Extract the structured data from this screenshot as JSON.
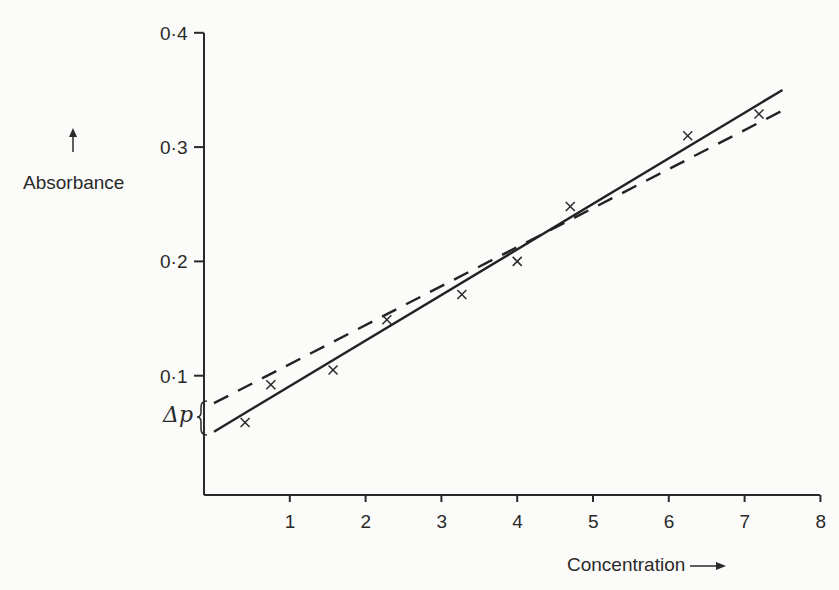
{
  "chart_data": {
    "type": "scatter",
    "title": "",
    "xlabel": "Concentration",
    "ylabel": "Absorbance",
    "xlim": [
      0,
      8
    ],
    "ylim": [
      0,
      0.4
    ],
    "x_ticks": [
      "1",
      "2",
      "3",
      "4",
      "5",
      "6",
      "7",
      "8"
    ],
    "y_ticks": [
      "0·1",
      "0·2",
      "0·3",
      "0·4"
    ],
    "grid": false,
    "legend": null,
    "marker": "x",
    "series": [
      {
        "name": "measured points",
        "x": [
          0.41,
          0.75,
          1.57,
          2.28,
          3.27,
          4.0,
          4.7,
          6.25,
          7.19
        ],
        "y": [
          0.059,
          0.092,
          0.105,
          0.149,
          0.171,
          0.2,
          0.248,
          0.31,
          0.329
        ]
      },
      {
        "name": "solid fit line",
        "style": "solid",
        "x": [
          0,
          7.5
        ],
        "y": [
          0.051,
          0.35
        ]
      },
      {
        "name": "dashed fit line",
        "style": "dashed",
        "x": [
          0,
          7.56
        ],
        "y": [
          0.076,
          0.334
        ]
      }
    ],
    "annotations": [
      {
        "text": "Δp",
        "note": "brace marking intercept difference between dashed and solid lines at x=0"
      }
    ]
  },
  "labels": {
    "ylabel": "Absorbance",
    "xlabel": "Concentration",
    "delta_p": "Δp",
    "y_ticks": [
      "0·1",
      "0·2",
      "0·3",
      "0·4"
    ],
    "x_ticks": [
      "1",
      "2",
      "3",
      "4",
      "5",
      "6",
      "7",
      "8"
    ]
  }
}
